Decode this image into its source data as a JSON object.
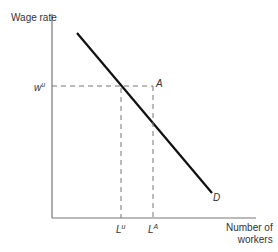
{
  "diagram": {
    "y_axis_label": "Wage rate",
    "x_axis_label_line1": "Number of",
    "x_axis_label_line2": "workers",
    "demand_label": "D",
    "point_label": "A",
    "wage_label_base": "w",
    "wage_label_sup": "u",
    "lu_base": "L",
    "lu_sup": "u",
    "la_base": "L",
    "la_sup": "A"
  }
}
